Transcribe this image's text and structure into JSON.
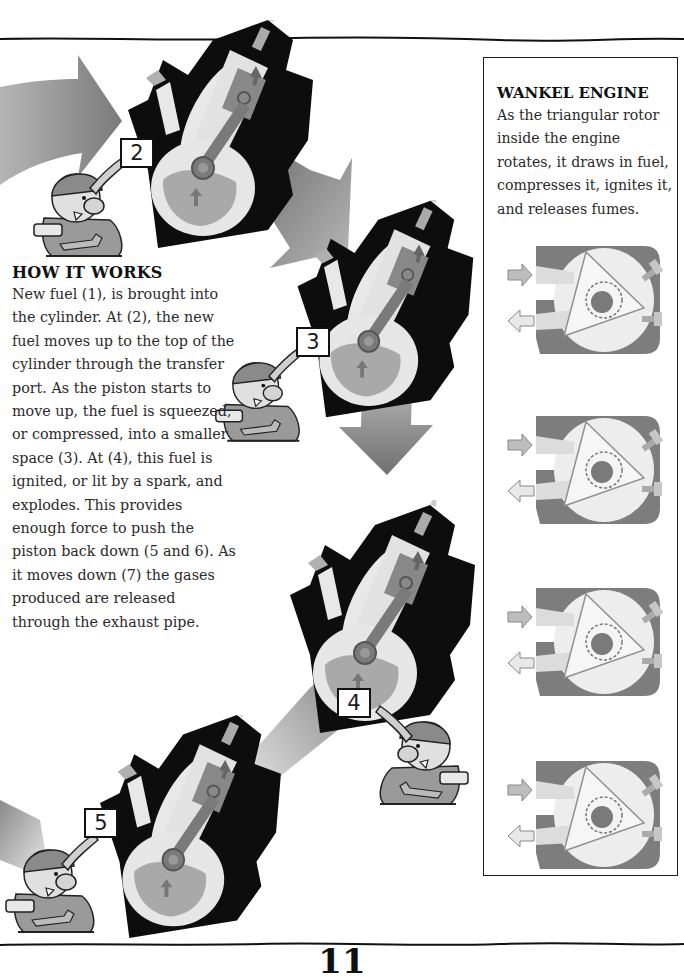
{
  "how_it_works": {
    "heading": "HOW IT WORKS",
    "body": "New fuel (1), is brought into the cylinder. At (2), the new fuel moves up to the top of the cylinder through the transfer port. As the piston starts to move up, the fuel is squeezed, or compressed, into a smaller space (3). At (4), this fuel is ignited, or lit by a spark, and explodes. This provides enough force to push the piston back down (5 and 6). As it moves down (7) the gases produced are released through the exhaust pipe."
  },
  "wankel_engine": {
    "heading": "WANKEL ENGINE",
    "body": "As the triangular rotor inside the engine rotates, it draws in fuel, compresses it, ignites it, and releases fumes.",
    "diagrams": [
      {
        "stage": "intake"
      },
      {
        "stage": "compression"
      },
      {
        "stage": "ignition"
      },
      {
        "stage": "exhaust"
      }
    ]
  },
  "engine_steps": [
    {
      "label": "2"
    },
    {
      "label": "3"
    },
    {
      "label": "4"
    },
    {
      "label": "5"
    }
  ],
  "page_number": "11",
  "colors": {
    "ink": "#111111",
    "body_text": "#2a2a2a",
    "engine_block": "#0d0d0d",
    "piston_gray": "#8a8a8a",
    "chamber_light": "#e4e4e4",
    "arrow_gray": "#9a9a9a",
    "rotor_housing": "#7d7d7d"
  }
}
